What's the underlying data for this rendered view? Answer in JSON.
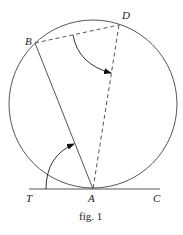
{
  "figure": {
    "caption": "fig. 1",
    "labels": {
      "B": "B",
      "D": "D",
      "T": "T",
      "A": "A",
      "C": "C"
    },
    "colors": {
      "stroke": "#555555",
      "arrow": "#111111",
      "text": "#222222"
    },
    "elements": [
      "circle",
      "tangent line TAC",
      "chord BA (solid)",
      "chord BD (dashed)",
      "chord DA (dashed)",
      "curved arrow from BD toward DA",
      "curved arrow from tangent TA toward BA"
    ]
  }
}
